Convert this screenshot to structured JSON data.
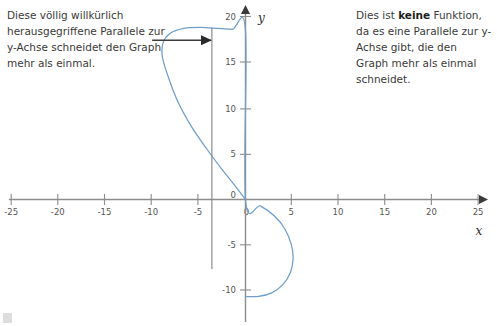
{
  "notes": {
    "left": {
      "name": "left-annotation",
      "text": "Diese völlig willkürlich herausgegriffene Parallele zur y-Achse schneidet den Graph mehr als einmal."
    },
    "right": {
      "name": "right-annotation",
      "part1": "Dies ist ",
      "emphasis": "keine",
      "part2": " Funktion, da es eine Parallele zur y-Achse gibt, die den Graph mehr als einmal schneidet."
    }
  },
  "colors": {
    "curve": "#6e9ec9",
    "axis": "#8c8c8c",
    "annotation_arrow": "#3c3c3c",
    "parallel_line": "#8c8c8c",
    "tick_text": "#555555"
  },
  "chart_data": {
    "type": "line",
    "title": "",
    "xlabel": "x",
    "ylabel": "y",
    "xlim": [
      -25,
      25
    ],
    "ylim": [
      -12,
      21
    ],
    "grid": false,
    "legend": null,
    "xticks": [
      -25,
      -20,
      -15,
      -10,
      -5,
      0,
      5,
      10,
      15,
      20,
      25
    ],
    "xtick_labels": [
      "-25",
      "-20",
      "-15",
      "-10",
      "-5",
      "0",
      "5",
      "10",
      "15",
      "20",
      "25"
    ],
    "yticks": [
      -10,
      -5,
      0,
      5,
      10,
      15,
      20
    ],
    "ytick_labels": [
      "-10",
      "-5",
      "0",
      "5",
      "10",
      "15",
      "20"
    ],
    "origin_label": "0",
    "series": [
      {
        "name": "relation-curve",
        "comment": "Closed sideways curve: large left lobe above x-axis plus small right lobe below x-axis, both passing through the origin.",
        "points": [
          [
            0.0,
            0.0
          ],
          [
            -1.2,
            1.6
          ],
          [
            -2.6,
            3.4
          ],
          [
            -4.2,
            5.6
          ],
          [
            -5.8,
            8.0
          ],
          [
            -7.2,
            10.6
          ],
          [
            -8.2,
            13.2
          ],
          [
            -8.9,
            15.6
          ],
          [
            -8.8,
            17.2
          ],
          [
            -8.0,
            18.2
          ],
          [
            -6.6,
            18.7
          ],
          [
            -4.8,
            18.8
          ],
          [
            -3.0,
            18.7
          ],
          [
            -1.4,
            18.6
          ],
          [
            0.0,
            18.5
          ],
          [
            0.0,
            0.0
          ],
          [
            1.6,
            -0.7
          ],
          [
            3.1,
            -1.8
          ],
          [
            4.2,
            -3.2
          ],
          [
            4.9,
            -4.9
          ],
          [
            5.1,
            -6.4
          ],
          [
            4.8,
            -8.0
          ],
          [
            4.0,
            -9.3
          ],
          [
            2.8,
            -10.2
          ],
          [
            1.4,
            -10.6
          ],
          [
            0.0,
            -10.6
          ]
        ]
      }
    ],
    "annotations": [
      {
        "name": "vertical-parallel-line",
        "kind": "vertical-line",
        "x": -3.6,
        "y_from": 18.8,
        "y_to": -7.6
      },
      {
        "name": "pointer-arrow",
        "kind": "arrow",
        "x_from": -10.0,
        "x_to": -3.7,
        "y": 17.4
      }
    ]
  }
}
